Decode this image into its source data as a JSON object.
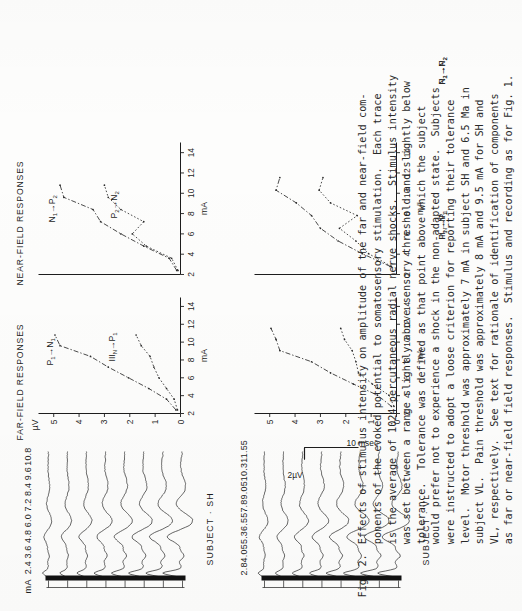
{
  "figure": {
    "label": "Fig.",
    "number": "2.",
    "caption_lines": [
      "Effects of stimulus intensity on amplitude of the far and near-field com-",
      "ponents of the evoked potential to somatosensory stimulation.  Each trace",
      "is the average of 1024 percutaneous radial nerve shocks.  Stimulus intensity",
      "was set between a range slightly above sensory threshold and slightly below",
      "tolerance.  Tolerance was defined as that point above which the subject",
      "would prefer not to experience a shock in the non-adapted state.  Subjects",
      "were instructed to adopt a loose criterion for reporting their tolerance",
      "level.  Motor threshold was approximately 7 mA in subject SH and 6.5 Ma in",
      "subject VL.  Pain threshold was approximately 8 mA and 9.5 mA for SH and",
      "VL, respectively.  See text for rationale of identification of components",
      "as far or near-field field responses.  Stimulus and recording as for Fig. 1."
    ]
  },
  "panels": {
    "far_field_title": "FAR-FIELD RESPONSES",
    "near_field_title": "NEAR-FIELD RESPONSES",
    "subject_sh_label": "SUBJECT · SH",
    "subject_vl_label": "SUBJECT · VL"
  },
  "waveforms": {
    "ma_header": "mA",
    "sh_intensities": [
      "2.4",
      "3.6",
      "4.8",
      "6.0",
      "7.2",
      "8.4",
      "9.6",
      "10.8"
    ],
    "vl_intensities": [
      "2.8",
      "4.05",
      "5.3",
      "6.55",
      "7.8",
      "9.05",
      "10.3",
      "11.55"
    ]
  },
  "scalebar": {
    "amplitude": "2µV",
    "time": "10 msec"
  },
  "chart_data": [
    {
      "id": "sh_far_field",
      "type": "line",
      "title": "FAR-FIELD RESPONSES",
      "subject": "SH",
      "xlabel": "mA",
      "ylabel": "µV",
      "xlim": [
        2,
        15
      ],
      "ylim": [
        0,
        5.6
      ],
      "xticks": [
        2,
        4,
        6,
        8,
        10,
        12,
        14
      ],
      "xticklabels": [
        "2",
        "4",
        "6",
        "8",
        "10",
        "12",
        "14"
      ],
      "yticks": [
        0,
        1,
        2,
        3,
        4,
        5
      ],
      "yticklabels": [
        "0",
        "1",
        "2",
        "3",
        "4",
        "5"
      ],
      "grid": false,
      "legend": "inline-annotation",
      "series": [
        {
          "name": "P₁→N₁",
          "label_html": "P<sub>1</sub>→N<sub>1</sub>",
          "style": "dash-dot",
          "x": [
            2.4,
            3.6,
            4.8,
            6.0,
            7.2,
            8.4,
            9.6,
            10.8
          ],
          "y": [
            0.18,
            0.55,
            1.25,
            2.05,
            2.85,
            3.55,
            4.75,
            4.95
          ]
        },
        {
          "name": "IIIₙ→P₁",
          "label_html": "III<sub>N</sub>→P<sub>1</sub>",
          "style": "dotted",
          "x": [
            2.4,
            3.6,
            4.8,
            6.0,
            7.2,
            8.4,
            9.6,
            10.8
          ],
          "y": [
            0.12,
            0.25,
            0.55,
            0.85,
            1.05,
            1.2,
            1.55,
            1.75
          ]
        }
      ]
    },
    {
      "id": "sh_near_field",
      "type": "line",
      "title": "NEAR-FIELD RESPONSES",
      "subject": "SH",
      "xlabel": "mA",
      "ylabel": "µV",
      "xlim": [
        2,
        15
      ],
      "ylim": [
        0,
        5.6
      ],
      "xticks": [
        2,
        4,
        6,
        8,
        10,
        12,
        14
      ],
      "xticklabels": [
        "2",
        "4",
        "6",
        "8",
        "10",
        "12",
        "14"
      ],
      "grid": false,
      "series": [
        {
          "name": "N₁→P₂",
          "label_html": "N<sub>1</sub>→P<sub>2</sub>",
          "style": "dash-dot",
          "x": [
            2.4,
            3.6,
            4.8,
            6.0,
            7.2,
            8.4,
            9.6,
            10.8
          ],
          "y": [
            0.15,
            0.45,
            1.45,
            2.35,
            3.15,
            3.45,
            4.6,
            4.75
          ]
        },
        {
          "name": "P₂→N₂",
          "label_html": "P<sub>2</sub>→N<sub>2</sub>",
          "style": "dotted",
          "x": [
            2.4,
            3.6,
            4.8,
            6.0,
            7.2,
            8.4,
            9.6,
            10.8
          ],
          "y": [
            0.1,
            0.35,
            1.35,
            1.9,
            1.45,
            2.35,
            2.85,
            3.0
          ]
        }
      ]
    },
    {
      "id": "vl_far_field",
      "type": "line",
      "title": "FAR-FIELD RESPONSES",
      "subject": "VL",
      "xlabel": "mA",
      "ylabel": "µV",
      "xlim": [
        2,
        15
      ],
      "ylim": [
        0,
        5.6
      ],
      "xticks": [
        2,
        4,
        6,
        8,
        10,
        12,
        14
      ],
      "xticklabels": [
        "2",
        "4",
        "6",
        "8",
        "10",
        "12",
        "14"
      ],
      "yticks": [
        0,
        1,
        2,
        3,
        4,
        5
      ],
      "yticklabels": [
        "0",
        "1",
        "2",
        "3",
        "4",
        "5"
      ],
      "grid": false,
      "series": [
        {
          "name": "P₁→N₁",
          "label_html": "P<sub>1</sub>→N<sub>1</sub>",
          "style": "dash-dot",
          "x": [
            2.8,
            4.05,
            5.3,
            6.55,
            7.8,
            9.05,
            10.3,
            11.55
          ],
          "y": [
            0.2,
            0.75,
            1.7,
            2.6,
            3.35,
            4.6,
            4.75,
            4.95
          ]
        },
        {
          "name": "IIIₙ→P₁",
          "label_html": "III<sub>N</sub>→P<sub>1</sub>",
          "style": "dotted",
          "x": [
            2.8,
            4.05,
            5.3,
            6.55,
            7.8,
            9.05,
            10.3,
            11.55
          ],
          "y": [
            0.1,
            0.3,
            0.95,
            1.5,
            1.6,
            1.75,
            2.05,
            2.2
          ]
        }
      ]
    },
    {
      "id": "vl_near_field",
      "type": "line",
      "title": "NEAR-FIELD RESPONSES",
      "subject": "VL",
      "xlabel": "mA",
      "ylabel": "µV",
      "xlim": [
        2,
        15
      ],
      "ylim": [
        0,
        5.6
      ],
      "xticks": [
        2,
        4,
        6,
        8,
        10,
        12,
        14
      ],
      "xticklabels": [
        "2",
        "4",
        "6",
        "8",
        "10",
        "12",
        "14"
      ],
      "grid": false,
      "series": [
        {
          "name": "N₁→P₂",
          "label_html": "N<sub>1</sub>→P<sub>2</sub>",
          "style": "dash-dot",
          "x": [
            2.8,
            4.05,
            5.3,
            6.55,
            7.8,
            9.05,
            10.3,
            11.55
          ],
          "y": [
            0.25,
            1.35,
            2.3,
            3.0,
            3.35,
            3.95,
            4.75,
            4.6
          ]
        },
        {
          "name": "P₂→N₂",
          "label_html": "P<sub>2</sub>→N<sub>2</sub>",
          "style": "dotted",
          "x": [
            2.8,
            4.05,
            5.3,
            6.55,
            7.8,
            9.05,
            10.3,
            11.55
          ],
          "y": [
            0.2,
            1.1,
            1.6,
            2.25,
            1.55,
            2.6,
            3.05,
            2.9
          ]
        }
      ]
    }
  ],
  "colors": {
    "ink": "#1d1d1d",
    "paper": "#fdfdfc",
    "trace": "#333333"
  }
}
